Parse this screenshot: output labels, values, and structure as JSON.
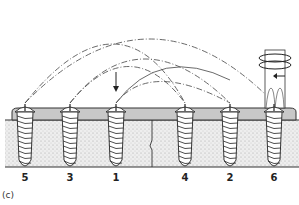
{
  "figure": {
    "panel_label": "(c)",
    "screws": [
      {
        "order": "5",
        "x": 25
      },
      {
        "order": "3",
        "x": 70
      },
      {
        "order": "1",
        "x": 116
      },
      {
        "order": "4",
        "x": 185
      },
      {
        "order": "2",
        "x": 230
      },
      {
        "order": "6",
        "x": 274
      }
    ],
    "colors": {
      "plate": "#c8c8c8",
      "bone": "#e4e4e4",
      "line": "#333333"
    }
  }
}
